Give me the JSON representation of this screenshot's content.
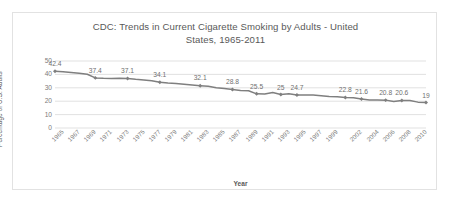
{
  "chart": {
    "title": "CDC: Trends in Current Cigarette Smoking by Adults - United States, 1965-2011",
    "title_line1": "CDC: Trends in Current Cigarette Smoking by Adults - United",
    "title_line2": "States, 1965-2011",
    "xlabel": "Year",
    "ylabel": "Percentage of U.S. Adults",
    "line_color": "#7f7f7f",
    "gridline_color": "#d9d9d9",
    "text_color": "#595959"
  },
  "chart_data": {
    "type": "line",
    "title": "CDC: Trends in Current Cigarette Smoking by Adults - United States, 1965-2011",
    "xlabel": "Year",
    "ylabel": "Percentage of U.S. Adults",
    "ylim": [
      0,
      50
    ],
    "yticks": [
      0,
      10,
      20,
      30,
      40,
      50
    ],
    "grid": true,
    "legend": "none",
    "xticks": [
      "1965",
      "1967",
      "1969",
      "1971",
      "1973",
      "1975",
      "1977",
      "1979",
      "1981",
      "1983",
      "1985",
      "1987",
      "1989",
      "1991",
      "1993",
      "1995",
      "1997",
      "1999",
      "2002",
      "2004",
      "2006",
      "2008",
      "2010"
    ],
    "x": [
      "1965",
      "1966",
      "1967",
      "1968",
      "1969",
      "1970",
      "1971",
      "1972",
      "1973",
      "1974",
      "1975",
      "1976",
      "1977",
      "1978",
      "1979",
      "1980",
      "1981",
      "1982",
      "1983",
      "1984",
      "1985",
      "1986",
      "1987",
      "1988",
      "1989",
      "1990",
      "1991",
      "1992",
      "1993",
      "1994",
      "1995",
      "1996",
      "1997",
      "1998",
      "1999",
      "2000",
      "2001",
      "2002",
      "2003",
      "2004",
      "2005",
      "2006",
      "2007",
      "2008",
      "2009",
      "2010",
      "2011"
    ],
    "values": [
      42.4,
      42.0,
      41.4,
      40.8,
      40.1,
      37.4,
      37.1,
      37.0,
      37.1,
      36.9,
      36.3,
      35.9,
      35.2,
      34.1,
      33.5,
      33.2,
      32.6,
      32.1,
      31.6,
      31.1,
      30.1,
      29.5,
      28.8,
      28.0,
      27.8,
      25.5,
      25.4,
      26.5,
      25.0,
      25.5,
      24.7,
      24.7,
      24.7,
      24.1,
      23.5,
      23.3,
      22.8,
      22.5,
      21.6,
      20.9,
      20.9,
      20.8,
      19.8,
      20.6,
      20.6,
      19.3,
      19.0
    ],
    "labeled_points": [
      {
        "year": "1965",
        "value": 42.4
      },
      {
        "year": "1970",
        "value": 37.4
      },
      {
        "year": "1974",
        "value": 37.1
      },
      {
        "year": "1978",
        "value": 34.1
      },
      {
        "year": "1983",
        "value": 32.1
      },
      {
        "year": "1987",
        "value": 28.8
      },
      {
        "year": "1990",
        "value": 25.5
      },
      {
        "year": "1993",
        "value": 25.0
      },
      {
        "year": "1995",
        "value": 24.7
      },
      {
        "year": "2001",
        "value": 22.8
      },
      {
        "year": "2003",
        "value": 21.6
      },
      {
        "year": "2006",
        "value": 20.8
      },
      {
        "year": "2008",
        "value": 20.6
      },
      {
        "year": "2011",
        "value": 19.0
      }
    ]
  }
}
